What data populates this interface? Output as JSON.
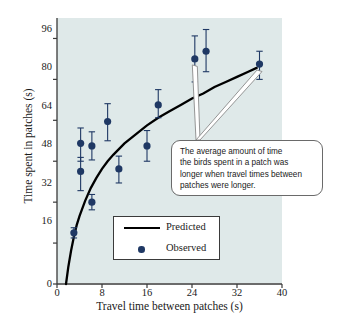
{
  "chart_data": {
    "type": "scatter",
    "title": "",
    "xlabel": "Travel time between patches (s)",
    "ylabel": "Time spent in patches (s)",
    "xlim": [
      0,
      40
    ],
    "ylim": [
      0,
      104
    ],
    "xticks": [
      0,
      8,
      16,
      24,
      32,
      40
    ],
    "yticks": [
      0,
      16,
      32,
      48,
      64,
      80,
      96
    ],
    "grid": false,
    "legend_position": "inside-bottom-left",
    "series": [
      {
        "name": "Predicted",
        "type": "line",
        "color": "#000000",
        "x": [
          1.6,
          2.0,
          2.5,
          3.0,
          3.5,
          4.0,
          5.0,
          6.0,
          7.0,
          8.0,
          9.0,
          10.0,
          12.0,
          14.0,
          16.0,
          18.0,
          20.0,
          22.0,
          24.0,
          26.0,
          28.0,
          30.0,
          32.0,
          34.0,
          35.5
        ],
        "y": [
          0.0,
          6.5,
          13.0,
          18.5,
          23.0,
          26.5,
          32.5,
          37.5,
          41.5,
          45.0,
          48.0,
          50.5,
          55.0,
          58.5,
          62.0,
          65.0,
          67.5,
          70.0,
          72.5,
          74.5,
          77.0,
          79.0,
          81.0,
          83.0,
          84.5
        ]
      },
      {
        "name": "Observed",
        "type": "scatter-errorbar",
        "color": "#1f3864",
        "points": [
          {
            "x": 3.0,
            "y": 20.0,
            "err_low": 2.0,
            "err_high": 2.0
          },
          {
            "x": 4.2,
            "y": 55.0,
            "err_low": 7.0,
            "err_high": 6.0
          },
          {
            "x": 4.2,
            "y": 44.0,
            "err_low": 7.5,
            "err_high": 5.5
          },
          {
            "x": 6.2,
            "y": 54.0,
            "err_low": 5.5,
            "err_high": 5.5
          },
          {
            "x": 6.2,
            "y": 32.0,
            "err_low": 3.0,
            "err_high": 3.0
          },
          {
            "x": 9.0,
            "y": 63.5,
            "err_low": 7.5,
            "err_high": 7.0
          },
          {
            "x": 11.0,
            "y": 45.0,
            "err_low": 5.5,
            "err_high": 5.0
          },
          {
            "x": 16.0,
            "y": 54.0,
            "err_low": 6.0,
            "err_high": 6.0
          },
          {
            "x": 18.0,
            "y": 70.0,
            "err_low": 5.0,
            "err_high": 6.0
          },
          {
            "x": 24.5,
            "y": 88.0,
            "err_low": 9.0,
            "err_high": 9.0
          },
          {
            "x": 26.5,
            "y": 91.0,
            "err_low": 8.0,
            "err_high": 8.5
          },
          {
            "x": 36.0,
            "y": 86.0,
            "err_low": 6.0,
            "err_high": 5.0
          }
        ]
      }
    ],
    "annotations": [
      {
        "text_lines": [
          "The average amount of time",
          "the birds spent in a patch was",
          "longer when travel times between",
          "patches were longer."
        ],
        "points_to": [
          [
            24.5,
            88.0
          ],
          [
            36.0,
            86.0
          ]
        ]
      }
    ]
  },
  "axis": {
    "x_ticks": [
      "0",
      "8",
      "16",
      "24",
      "32",
      "40"
    ],
    "y_ticks": [
      "96",
      "80",
      "64",
      "48",
      "32",
      "16",
      "0"
    ],
    "x_title": "Travel time between patches (s)",
    "y_title": "Time spent in patches (s)"
  },
  "legend": {
    "items": [
      {
        "label": "Predicted",
        "marker": "line"
      },
      {
        "label": "Observed",
        "marker": "dot"
      }
    ]
  },
  "callout": {
    "line1": "The average amount of time",
    "line2": "the birds spent in a patch was",
    "line3": "longer when travel times between",
    "line4": "patches were longer."
  },
  "colors": {
    "plot_background": "#dfe9e9",
    "observed_marker": "#1f3864",
    "predicted_line": "#000000",
    "axis": "#3a3a3a"
  }
}
